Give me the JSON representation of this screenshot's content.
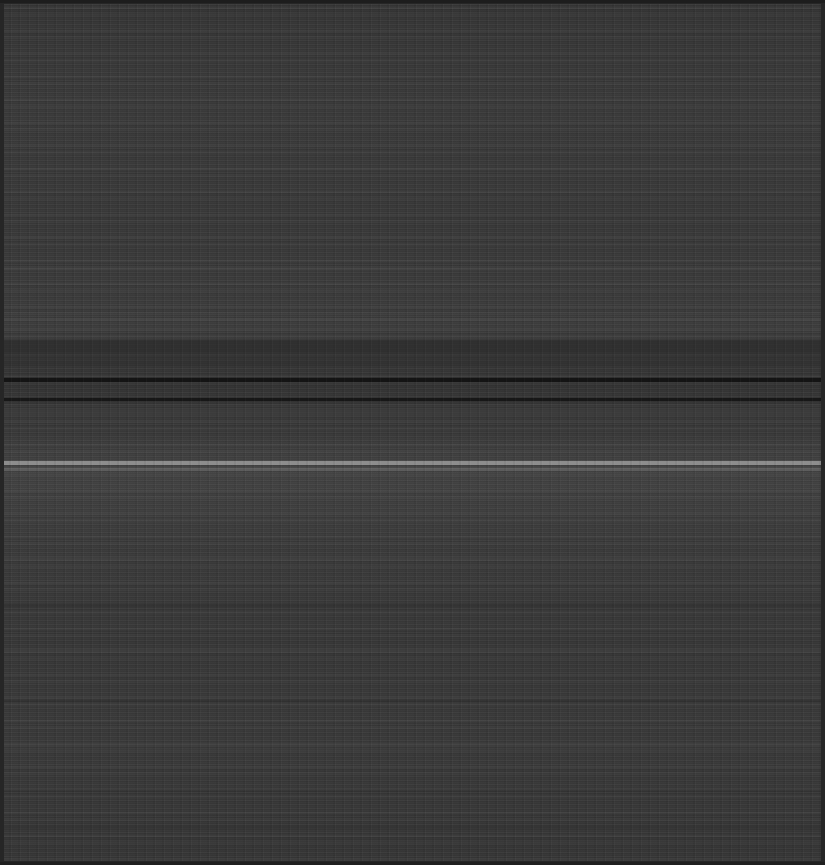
{
  "canvas": {
    "width": 825,
    "height": 865,
    "base_color": "#3a3a3a",
    "edge_border_color": "#262626",
    "top_rule_color": "#1d1d1d",
    "bottom_rule_color": "#1f1f1f"
  },
  "appearance": {
    "content_legible": false,
    "description": "Severely degraded screenshot: uniform dark gray field with dense horizontal scanline smearing; no text, icons or controls are recoverable.",
    "darkest_tone": "#141414",
    "brightest_tone": "#9a9a9a",
    "midtone": "#3a3a3a"
  },
  "bands": [
    {
      "name": "upper-faint-streak",
      "top": 168,
      "height": 2,
      "color": "#474747",
      "opacity": 0.55
    },
    {
      "name": "upper-mid-streak",
      "top": 236,
      "height": 2,
      "color": "#444444",
      "opacity": 0.45
    },
    {
      "name": "mid-light-streak",
      "top": 268,
      "height": 2,
      "color": "#4c4c4c",
      "opacity": 0.5
    },
    {
      "name": "pre-divider-haze",
      "top": 318,
      "height": 3,
      "color": "#4f4f4f",
      "opacity": 0.5
    },
    {
      "name": "smear-cluster-upper",
      "top": 340,
      "height": 14,
      "color": "#2c2c2c",
      "opacity": 0.7
    },
    {
      "name": "smear-cluster-lower",
      "top": 356,
      "height": 10,
      "color": "#303030",
      "opacity": 0.6
    },
    {
      "name": "divider-rule-primary",
      "top": 378,
      "height": 4,
      "color": "#141414",
      "opacity": 1.0
    },
    {
      "name": "divider-rule-secondary",
      "top": 398,
      "height": 3,
      "color": "#171717",
      "opacity": 1.0
    },
    {
      "name": "post-divider-band",
      "top": 408,
      "height": 8,
      "color": "#3f3f3f",
      "opacity": 0.6
    },
    {
      "name": "highlight-band-main",
      "top": 461,
      "height": 4,
      "color": "#9a9a9a",
      "opacity": 0.85
    },
    {
      "name": "highlight-band-echo",
      "top": 468,
      "height": 3,
      "color": "#6e6e6e",
      "opacity": 0.6
    },
    {
      "name": "lower-row-band-1",
      "top": 556,
      "height": 3,
      "color": "#434343",
      "opacity": 0.5
    },
    {
      "name": "lower-row-band-2",
      "top": 604,
      "height": 3,
      "color": "#2e2e2e",
      "opacity": 0.6
    },
    {
      "name": "lower-row-band-3",
      "top": 648,
      "height": 3,
      "color": "#424242",
      "opacity": 0.5
    },
    {
      "name": "lower-row-band-4",
      "top": 700,
      "height": 2,
      "color": "#2d2d2d",
      "opacity": 0.55
    },
    {
      "name": "lower-row-band-5",
      "top": 744,
      "height": 3,
      "color": "#454545",
      "opacity": 0.5
    },
    {
      "name": "lower-row-band-6",
      "top": 790,
      "height": 2,
      "color": "#303030",
      "opacity": 0.5
    },
    {
      "name": "bottom-haze-band",
      "top": 826,
      "height": 4,
      "color": "#343434",
      "opacity": 0.6
    }
  ]
}
